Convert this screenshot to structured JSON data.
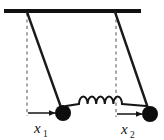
{
  "figure": {
    "kind": "physics-diagram",
    "width": 164,
    "height": 139,
    "background_color": "#ffffff"
  },
  "colors": {
    "ink": "#141414",
    "support_bar": "#111111",
    "rod": "#1a1a1a",
    "bob": "#0d0d0d",
    "spring": "#141414",
    "dashed_reference": "#8c8c8c",
    "arrow": "#141414",
    "background": "#ffffff"
  },
  "support": {
    "name": "ceiling-support-bar",
    "x_start": 4,
    "x_end": 141,
    "y": 11,
    "thickness": 4
  },
  "pendulums": [
    {
      "id": "left",
      "name": "pendulum-left",
      "pivot_x": 27,
      "pivot_y": 11,
      "bob_x": 63,
      "bob_y": 113,
      "bob_radius": 8,
      "rod_width": 2.4,
      "reference_line_x": 27,
      "reference_line_y_start": 13,
      "reference_line_y_end": 116,
      "displacement": {
        "name": "displacement-x1",
        "symbol": "x",
        "subscript": "1",
        "arrow_x_start": 28,
        "arrow_x_end": 56,
        "arrow_y": 113,
        "label_x": 34,
        "label_y": 133
      }
    },
    {
      "id": "right",
      "name": "pendulum-right",
      "pivot_x": 115,
      "pivot_y": 11,
      "bob_x": 150,
      "bob_y": 114,
      "bob_radius": 8,
      "rod_width": 2.4,
      "reference_line_x": 116,
      "reference_line_y_start": 13,
      "reference_line_y_end": 117,
      "displacement": {
        "name": "displacement-x2",
        "symbol": "x",
        "subscript": "2",
        "arrow_x_start": 117,
        "arrow_x_end": 143,
        "arrow_y": 114,
        "label_x": 121,
        "label_y": 134
      }
    }
  ],
  "spring": {
    "name": "coupling-spring",
    "attach_left_x": 66,
    "attach_right_x": 146,
    "y": 104,
    "coil_count": 5,
    "coil_start_x": 79,
    "coil_end_x": 122,
    "coil_radius_x": 4.3,
    "coil_radius_y": 7.5,
    "stroke_width": 1.9
  }
}
